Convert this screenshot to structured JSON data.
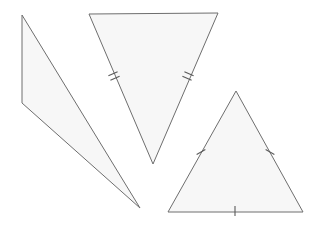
{
  "figure": {
    "title": "",
    "background_color": "#ffffff",
    "canvas": {
      "width": 322,
      "height": 226
    },
    "style": {
      "fill_color": "#f7f7f7",
      "stroke_color": "#6e6e6e",
      "stroke_width": 1,
      "tick_color": "#5a5a5a",
      "tick_width": 1
    },
    "shapes": [
      {
        "id": "left-triangle",
        "name": "thin-sliver-triangle",
        "points": "22,15 22,103 140,208",
        "fill": "#f7f7f7",
        "stroke": "#6e6e6e",
        "tick_marks": []
      },
      {
        "id": "middle-triangle",
        "name": "inverted-isosceles-triangle",
        "points": "89,14 218,13 153,164",
        "fill": "#f7f7f7",
        "stroke": "#6e6e6e",
        "tick_marks": [
          {
            "id": "mid-left-double-tick",
            "edge": "left",
            "count": 2,
            "cx": 114,
            "cy": 76,
            "angle": 66.5
          },
          {
            "id": "mid-right-double-tick",
            "edge": "right",
            "count": 2,
            "cx": 188,
            "cy": 76,
            "angle": -66.7
          }
        ]
      },
      {
        "id": "right-triangle",
        "name": "upright-isosceles-triangle",
        "points": "236,91 303,212 168,212",
        "fill": "#f7f7f7",
        "stroke": "#6e6e6e",
        "tick_marks": [
          {
            "id": "right-left-single-tick",
            "edge": "left",
            "count": 1,
            "cx": 201,
            "cy": 152,
            "angle": 60.6
          },
          {
            "id": "right-right-single-tick",
            "edge": "right",
            "count": 1,
            "cx": 270,
            "cy": 152,
            "angle": -61.0
          },
          {
            "id": "right-bottom-single-tick",
            "edge": "bottom",
            "count": 1,
            "cx": 235,
            "cy": 211,
            "angle": 0
          }
        ]
      }
    ]
  }
}
